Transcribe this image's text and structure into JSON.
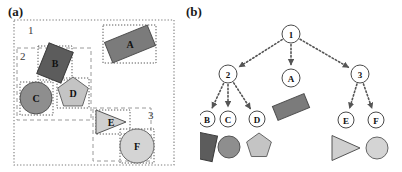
{
  "figure": {
    "width": 402,
    "height": 172,
    "background": "#ffffff"
  },
  "panels": [
    {
      "id": "a",
      "label": "(a)",
      "caption": "scene with nested group bounding boxes"
    },
    {
      "id": "b",
      "label": "(b)",
      "caption": "scene decomposition tree"
    }
  ],
  "panel_a": {
    "group_labels": [
      {
        "name": "group-1",
        "text": "1",
        "x": 28,
        "y": 34
      },
      {
        "name": "group-2",
        "text": "2",
        "x": 20,
        "y": 60
      },
      {
        "name": "group-3",
        "text": "3",
        "x": 148,
        "y": 119
      }
    ],
    "boxes": [
      {
        "name": "box-scene-1",
        "style": "dotted",
        "color": "#7a7a7a",
        "x": 14,
        "y": 20,
        "w": 160,
        "h": 145
      },
      {
        "name": "box-group-2",
        "style": "dashed",
        "color": "#9a9a9a",
        "x": 17,
        "y": 48,
        "w": 74,
        "h": 72
      },
      {
        "name": "box-group-3",
        "style": "dashed",
        "color": "#9a9a9a",
        "x": 93,
        "y": 108,
        "w": 58,
        "h": 53
      },
      {
        "name": "box-object-a",
        "style": "dotted",
        "color": "#5a5a5a",
        "x": 103,
        "y": 25,
        "w": 53,
        "h": 38
      },
      {
        "name": "box-object-b",
        "style": "dotted",
        "color": "#5a5a5a",
        "x": 38,
        "y": 46,
        "w": 34,
        "h": 34
      },
      {
        "name": "box-object-c",
        "style": "dotted",
        "color": "#5a5a5a",
        "x": 20,
        "y": 82,
        "w": 33,
        "h": 33
      },
      {
        "name": "box-object-d",
        "style": "dotted",
        "color": "#5a5a5a",
        "x": 57,
        "y": 78,
        "w": 32,
        "h": 30
      },
      {
        "name": "box-object-e",
        "style": "dotted",
        "color": "#5a5a5a",
        "x": 96,
        "y": 110,
        "w": 34,
        "h": 24
      },
      {
        "name": "box-object-f",
        "style": "dotted",
        "color": "#5a5a5a",
        "x": 120,
        "y": 129,
        "w": 34,
        "h": 34
      }
    ],
    "shapes": [
      {
        "name": "shape-a",
        "letter": "A",
        "type": "rectangle",
        "fill": "#7b7b7b",
        "stroke": "#4e4e4e",
        "cx": 130,
        "cy": 44,
        "w": 46,
        "h": 22,
        "rotation": -22
      },
      {
        "name": "shape-b",
        "letter": "B",
        "type": "rectangle",
        "fill": "#5c5c5c",
        "stroke": "#3a3a3a",
        "cx": 55,
        "cy": 63,
        "w": 26,
        "h": 33,
        "rotation": 22
      },
      {
        "name": "shape-c",
        "letter": "C",
        "type": "circle",
        "fill": "#8e8e8e",
        "stroke": "#555555",
        "cx": 36,
        "cy": 98,
        "r": 16
      },
      {
        "name": "shape-d",
        "letter": "D",
        "type": "pentagon",
        "fill": "#c4c4c4",
        "stroke": "#666666",
        "cx": 73,
        "cy": 93,
        "r": 16
      },
      {
        "name": "shape-e",
        "letter": "E",
        "type": "triangle",
        "fill": "#cfcfcf",
        "stroke": "#555555",
        "cx": 111,
        "cy": 122,
        "w": 30,
        "h": 24
      },
      {
        "name": "shape-f",
        "letter": "F",
        "type": "circle",
        "fill": "#d4d4d4",
        "stroke": "#666666",
        "cx": 137,
        "cy": 146,
        "r": 17
      }
    ]
  },
  "panel_b": {
    "tree": {
      "root": "1",
      "nodes": [
        {
          "name": "tree-node-1",
          "label": "1",
          "x": 91,
          "y": 34,
          "r": 9,
          "level": 0
        },
        {
          "name": "tree-node-2",
          "label": "2",
          "x": 28,
          "y": 74,
          "r": 9,
          "level": 1
        },
        {
          "name": "tree-node-a",
          "label": "A",
          "x": 91,
          "y": 78,
          "r": 9,
          "level": 1
        },
        {
          "name": "tree-node-3",
          "label": "3",
          "x": 160,
          "y": 74,
          "r": 9,
          "level": 1
        },
        {
          "name": "tree-node-b",
          "label": "B",
          "x": 7,
          "y": 119,
          "r": 8,
          "level": 2
        },
        {
          "name": "tree-node-c",
          "label": "C",
          "x": 28,
          "y": 119,
          "r": 8,
          "level": 2
        },
        {
          "name": "tree-node-d",
          "label": "D",
          "x": 57,
          "y": 119,
          "r": 8,
          "level": 2
        },
        {
          "name": "tree-node-e",
          "label": "E",
          "x": 146,
          "y": 120,
          "r": 8,
          "level": 2
        },
        {
          "name": "tree-node-f",
          "label": "F",
          "x": 176,
          "y": 120,
          "r": 8,
          "level": 2
        }
      ],
      "edges": [
        {
          "name": "edge-1-2",
          "from": "1",
          "to": "2"
        },
        {
          "name": "edge-1-a",
          "from": "1",
          "to": "A"
        },
        {
          "name": "edge-1-3",
          "from": "1",
          "to": "3"
        },
        {
          "name": "edge-2-b",
          "from": "2",
          "to": "B"
        },
        {
          "name": "edge-2-c",
          "from": "2",
          "to": "C"
        },
        {
          "name": "edge-2-d",
          "from": "2",
          "to": "D"
        },
        {
          "name": "edge-3-e",
          "from": "3",
          "to": "E"
        },
        {
          "name": "edge-3-f",
          "from": "3",
          "to": "F"
        }
      ],
      "edge_style": "dotted-arrow",
      "edge_color": "#555555"
    },
    "leaf_shapes": [
      {
        "name": "tree-shape-a",
        "for": "A",
        "type": "rectangle",
        "fill": "#7b7b7b",
        "stroke": "#4e4e4e",
        "cx": 91,
        "cy": 107,
        "w": 34,
        "h": 15,
        "rotation": -22
      },
      {
        "name": "tree-shape-b",
        "for": "B",
        "type": "rectangle",
        "fill": "#5c5c5c",
        "stroke": "#3a3a3a",
        "cx": 6,
        "cy": 147,
        "w": 18,
        "h": 26,
        "rotation": 12
      },
      {
        "name": "tree-shape-c",
        "for": "C",
        "type": "circle",
        "fill": "#8e8e8e",
        "stroke": "#555555",
        "cx": 29,
        "cy": 147,
        "r": 11
      },
      {
        "name": "tree-shape-d",
        "for": "D",
        "type": "pentagon",
        "fill": "#c4c4c4",
        "stroke": "#666666",
        "cx": 59,
        "cy": 146,
        "r": 13
      },
      {
        "name": "tree-shape-e",
        "for": "E",
        "type": "triangle",
        "fill": "#cfcfcf",
        "stroke": "#555555",
        "cx": 146,
        "cy": 148,
        "w": 28,
        "h": 25
      },
      {
        "name": "tree-shape-f",
        "for": "F",
        "type": "circle",
        "fill": "#d4d4d4",
        "stroke": "#666666",
        "cx": 177,
        "cy": 148,
        "r": 11
      }
    ]
  }
}
